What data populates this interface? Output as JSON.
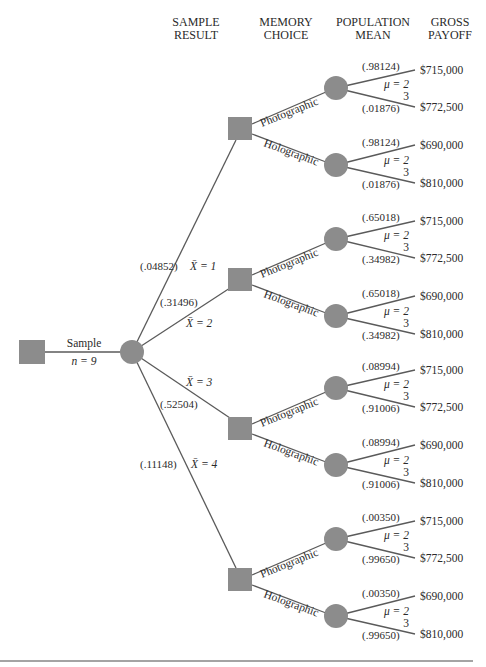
{
  "headers": {
    "sample_result": [
      "SAMPLE",
      "RESULT"
    ],
    "memory_choice": [
      "MEMORY",
      "CHOICE"
    ],
    "population_mean": [
      "POPULATION",
      "MEAN"
    ],
    "gross_payoff": [
      "GROSS",
      "PAYOFF"
    ]
  },
  "root": {
    "branch_label": "Sample",
    "sample_size_label": "n = 9"
  },
  "sample_results": [
    {
      "xbar_label": "X̄ = 1",
      "probability": "(.04852)"
    },
    {
      "xbar_label": "X̄ = 2",
      "probability": "(.31496)"
    },
    {
      "xbar_label": "X̄ = 3",
      "probability": "(.52504)"
    },
    {
      "xbar_label": "X̄ = 4",
      "probability": "(.11148)"
    }
  ],
  "memory_choices": [
    "Photographic",
    "Holographic"
  ],
  "mu_labels": {
    "top": "μ = 2",
    "bottom": "3"
  },
  "posterior_probabilities": [
    {
      "mu2": "(.98124)",
      "mu3": "(.01876)"
    },
    {
      "mu2": "(.65018)",
      "mu3": "(.34982)"
    },
    {
      "mu2": "(.08994)",
      "mu3": "(.91006)"
    },
    {
      "mu2": "(.00350)",
      "mu3": "(.99650)"
    }
  ],
  "payoffs": {
    "Photographic": {
      "mu2": "$715,000",
      "mu3": "$772,500"
    },
    "Holographic": {
      "mu2": "$690,000",
      "mu3": "$810,000"
    }
  },
  "colors": {
    "node_fill": "#8c8c8c",
    "edge": "#5a5a5a",
    "text": "#2a2a2a"
  }
}
